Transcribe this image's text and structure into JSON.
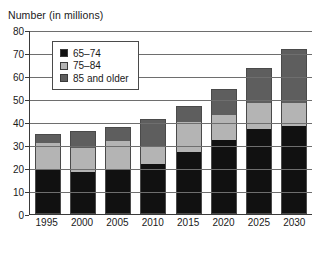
{
  "chart_data": {
    "type": "bar",
    "stacked": true,
    "title": "Number (in millions)",
    "xlabel": "",
    "ylabel": "",
    "ylim": [
      0,
      80
    ],
    "ytick_step": 10,
    "yticks": [
      "80",
      "70",
      "60",
      "50",
      "40",
      "30",
      "20",
      "10",
      "0"
    ],
    "grid": true,
    "legend_position": "upper-left-inside",
    "categories": [
      "1995",
      "2000",
      "2005",
      "2010",
      "2015",
      "2020",
      "2025",
      "2030"
    ],
    "series": [
      {
        "name": "65–74",
        "color": "#111111",
        "values": [
          18.8,
          18.0,
          18.8,
          21.5,
          26.5,
          31.8,
          36.6,
          38.0
        ]
      },
      {
        "name": "75–84",
        "color": "#b4b4b4",
        "values": [
          11.7,
          10.3,
          12.4,
          7.6,
          13.0,
          10.8,
          11.3,
          9.7
        ]
      },
      {
        "name": "85 and older",
        "color": "#5e5e5e",
        "values": [
          3.6,
          7.0,
          5.9,
          11.2,
          6.8,
          11.1,
          14.6,
          23.0
        ]
      }
    ],
    "totals": [
      34.1,
      35.3,
      37.1,
      40.3,
      46.3,
      53.7,
      62.5,
      70.7
    ]
  },
  "legend": {
    "items": [
      {
        "label": "65–74",
        "swatch": "black-swatch"
      },
      {
        "label": "75–84",
        "swatch": "light-gray-swatch"
      },
      {
        "label": "85 and older",
        "swatch": "dark-gray-swatch"
      }
    ]
  },
  "colors": {
    "series_65_74": "#111111",
    "series_75_84": "#b4b4b4",
    "series_85_older": "#5e5e5e",
    "axis": "#3a3a3a",
    "gridline": "#6e6e6e",
    "background": "#ffffff"
  }
}
